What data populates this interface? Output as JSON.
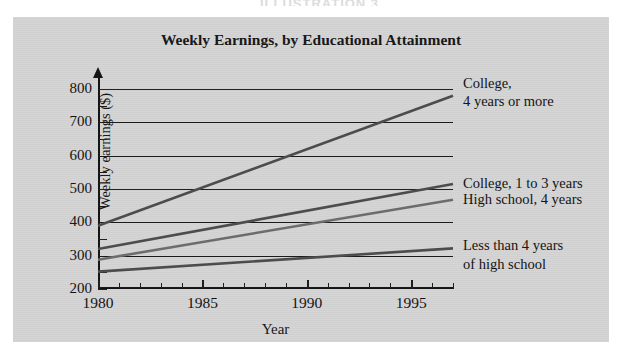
{
  "page": {
    "heading": "ILLUSTRATION 3"
  },
  "chart_data": {
    "type": "line",
    "title": "Weekly Earnings, by Educational Attainment",
    "xlabel": "Year",
    "ylabel": "Weekly earnings ($)",
    "xlim": [
      1980,
      1997
    ],
    "ylim": [
      200,
      800
    ],
    "ytick_labels": [
      "800",
      "700",
      "600",
      "500",
      "400",
      "300",
      "200"
    ],
    "ytick_values": [
      800,
      700,
      600,
      500,
      400,
      300,
      200
    ],
    "yminor_step": 50,
    "xtick_labels": [
      "1980",
      "1985",
      "1990",
      "1995"
    ],
    "xtick_values": [
      1980,
      1985,
      1990,
      1995
    ],
    "xtick_step": 1,
    "grid": "horizontal",
    "legend_position": "right-inline",
    "series": [
      {
        "name": "College,\n4 years or more",
        "label_line1": "College,",
        "label_line2": "4 years or more",
        "color": "#4a4a4a",
        "x": [
          1980,
          1997
        ],
        "values": [
          390,
          780
        ]
      },
      {
        "name": "College, 1 to 3 years",
        "label_line1": "College, 1 to 3 years",
        "label_line2": "",
        "color": "#4a4a4a",
        "x": [
          1980,
          1997
        ],
        "values": [
          320,
          515
        ]
      },
      {
        "name": "High school, 4 years",
        "label_line1": "High school, 4 years",
        "label_line2": "",
        "color": "#6b6b6b",
        "x": [
          1980,
          1997
        ],
        "values": [
          288,
          468
        ]
      },
      {
        "name": "Less than 4 years\nof high school",
        "label_line1": "Less than 4 years",
        "label_line2": "of high school",
        "color": "#4a4a4a",
        "x": [
          1980,
          1997
        ],
        "values": [
          252,
          322
        ]
      }
    ]
  }
}
